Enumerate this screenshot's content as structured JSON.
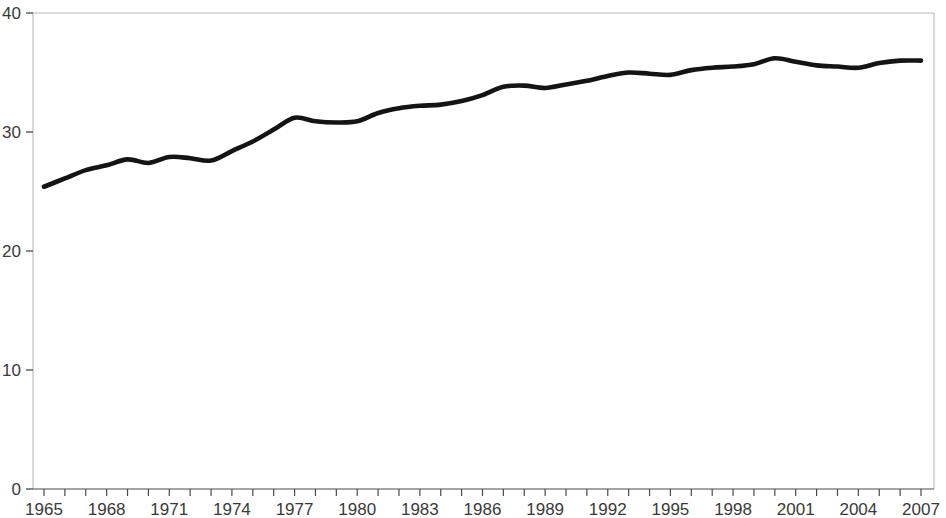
{
  "chart_data": {
    "type": "line",
    "title": "",
    "subtitle": "",
    "xlabel": "",
    "ylabel": "",
    "xlim": [
      1965,
      2007
    ],
    "ylim": [
      0,
      40
    ],
    "grid": false,
    "legend": null,
    "y_ticks": [
      0,
      10,
      20,
      30,
      40
    ],
    "y_tick_labels": [
      "0",
      "10",
      "20",
      "30",
      "40"
    ],
    "x_ticks": [
      1965,
      1966,
      1967,
      1968,
      1969,
      1970,
      1971,
      1972,
      1973,
      1974,
      1975,
      1976,
      1977,
      1978,
      1979,
      1980,
      1981,
      1982,
      1983,
      1984,
      1985,
      1986,
      1987,
      1988,
      1989,
      1990,
      1991,
      1992,
      1993,
      1994,
      1995,
      1996,
      1997,
      1998,
      1999,
      2000,
      2001,
      2002,
      2003,
      2004,
      2005,
      2006,
      2007
    ],
    "x_tick_labels": [
      "1965",
      "1968",
      "1971",
      "1974",
      "1977",
      "1980",
      "1983",
      "1986",
      "1989",
      "1992",
      "1995",
      "1998",
      "2001",
      "2004",
      "2007"
    ],
    "x_labeled_ticks": [
      1965,
      1968,
      1971,
      1974,
      1977,
      1980,
      1983,
      1986,
      1989,
      1992,
      1995,
      1998,
      2001,
      2004,
      2007
    ],
    "series": [
      {
        "name": "series-1",
        "color": "#141414",
        "x": [
          1965,
          1966,
          1967,
          1968,
          1969,
          1970,
          1971,
          1972,
          1973,
          1974,
          1975,
          1976,
          1977,
          1978,
          1979,
          1980,
          1981,
          1982,
          1983,
          1984,
          1985,
          1986,
          1987,
          1988,
          1989,
          1990,
          1991,
          1992,
          1993,
          1994,
          1995,
          1996,
          1997,
          1998,
          1999,
          2000,
          2001,
          2002,
          2003,
          2004,
          2005,
          2006,
          2007
        ],
        "values": [
          25.4,
          26.1,
          26.8,
          27.2,
          27.7,
          27.4,
          27.9,
          27.8,
          27.6,
          28.4,
          29.2,
          30.2,
          31.2,
          30.9,
          30.8,
          30.9,
          31.6,
          32.0,
          32.2,
          32.3,
          32.6,
          33.1,
          33.8,
          33.9,
          33.7,
          34.0,
          34.3,
          34.7,
          35.0,
          34.9,
          34.8,
          35.2,
          35.4,
          35.5,
          35.7,
          36.2,
          35.9,
          35.6,
          35.5,
          35.4,
          35.8,
          36.0,
          36.0
        ]
      }
    ]
  },
  "plot": {
    "left": 33,
    "right": 934,
    "top": 13,
    "bottom": 489,
    "x_first_tick_px": 44,
    "x_last_tick_px": 921,
    "background_color": "#ffffff",
    "frame_color": "#b9b9b9",
    "axis_color": "#4a4a4a",
    "tick_label_color": "#3a3a3a"
  }
}
